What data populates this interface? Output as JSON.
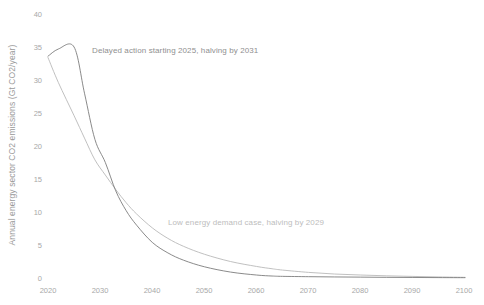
{
  "chart_data": {
    "type": "line",
    "title": "",
    "xlabel": "",
    "ylabel": "Annual energy sector CO2 emissions (Gt CO2/year)",
    "xlim": [
      2020,
      2100
    ],
    "ylim": [
      0,
      40
    ],
    "grid": false,
    "legend_position": "inline-annotations",
    "xticks": [
      "2020",
      "2030",
      "2040",
      "2050",
      "2060",
      "2070",
      "2080",
      "2090",
      "2100"
    ],
    "yticks": [
      "0",
      "5",
      "10",
      "15",
      "20",
      "25",
      "30",
      "35",
      "40"
    ],
    "x": [
      2020,
      2022,
      2025,
      2027,
      2029,
      2031,
      2033,
      2035,
      2037,
      2040,
      2043,
      2046,
      2050,
      2055,
      2060,
      2063,
      2065,
      2070,
      2075,
      2080,
      2085,
      2090,
      2095,
      2100
    ],
    "series": [
      {
        "name": "Delayed action starting 2025, halving by 2031",
        "color": "#7d7d7d",
        "values": [
          33.6,
          34.7,
          35.0,
          28.0,
          21.0,
          17.5,
          13.2,
          10.2,
          8.0,
          5.4,
          3.8,
          2.7,
          1.7,
          0.9,
          0.45,
          0.3,
          0.25,
          0.2,
          0.16,
          0.13,
          0.1,
          0.08,
          0.06,
          0.05
        ]
      },
      {
        "name": "Low energy demand case, halving by 2029",
        "color": "#b9b9b9",
        "values": [
          33.4,
          29.6,
          24.6,
          21.2,
          17.9,
          15.6,
          13.4,
          11.4,
          9.7,
          7.6,
          6.0,
          4.8,
          3.6,
          2.5,
          1.75,
          1.4,
          1.2,
          0.85,
          0.6,
          0.45,
          0.33,
          0.24,
          0.16,
          0.1
        ]
      }
    ],
    "annotations": [
      {
        "id": "delayed",
        "text": "Delayed action starting 2025, halving by 2031",
        "color": "#8f8f8f"
      },
      {
        "id": "lowdemand",
        "text": "Low energy demand case, halving by 2029",
        "color": "#bdbdbd"
      }
    ]
  },
  "axes": {
    "y_title": "Annual energy sector CO2 emissions (Gt CO2/year)",
    "y_tick_labels": [
      "40",
      "35",
      "30",
      "25",
      "20",
      "15",
      "10",
      "5",
      "0"
    ],
    "x_tick_labels": [
      "2020",
      "2030",
      "2040",
      "2050",
      "2060",
      "2070",
      "2080",
      "2090",
      "2100"
    ]
  }
}
